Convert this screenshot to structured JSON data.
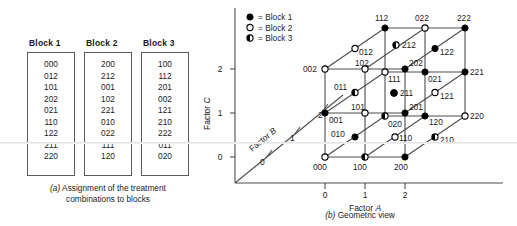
{
  "panel_a": {
    "caption_prefix": "(a)",
    "caption": " Assignment of the treatment",
    "caption_line2": "combinations to blocks",
    "blocks": [
      {
        "title": "Block 1",
        "runs": [
          "000",
          "012",
          "101",
          "202",
          "021",
          "110",
          "122",
          "211",
          "220"
        ]
      },
      {
        "title": "Block 2",
        "runs": [
          "200",
          "212",
          "001",
          "102",
          "221",
          "010",
          "022",
          "111",
          "120"
        ]
      },
      {
        "title": "Block 3",
        "runs": [
          "100",
          "112",
          "201",
          "002",
          "121",
          "210",
          "222",
          "011",
          "020"
        ]
      }
    ]
  },
  "panel_b": {
    "caption_prefix": "(b)",
    "caption": " Geometric view",
    "axes": {
      "x_label": "Factor ",
      "x_label_italic": "A",
      "y_label": "Factor ",
      "y_label_italic": "C",
      "z_label": "Factor ",
      "z_label_italic": "B",
      "x_ticks": [
        "0",
        "1",
        "2"
      ],
      "y_ticks": [
        "0",
        "1",
        "2"
      ],
      "z_ticks": [
        "0",
        "1",
        "2"
      ]
    },
    "legend": [
      {
        "marker": "filled-circle-icon",
        "text": "= Block 1"
      },
      {
        "marker": "open-circle-icon",
        "text": "= Block 2"
      },
      {
        "marker": "half-circle-icon",
        "text": "= Block 3"
      }
    ],
    "colors": {
      "line": "#4d4d4d",
      "marker_fill": "#000000",
      "marker_stroke": "#000000",
      "text": "#1a1a1a"
    },
    "points": [
      {
        "label": "000",
        "block": 2,
        "marker": "open"
      },
      {
        "label": "100",
        "block": 3,
        "marker": "half"
      },
      {
        "label": "200",
        "block": 1,
        "marker": "filled"
      },
      {
        "label": "010",
        "block": 2,
        "marker": "filled"
      },
      {
        "label": "110",
        "block": 1,
        "marker": "open"
      },
      {
        "label": "210",
        "block": 3,
        "marker": "half"
      },
      {
        "label": "020",
        "block": 3,
        "marker": "half"
      },
      {
        "label": "120",
        "block": 2,
        "marker": "filled"
      },
      {
        "label": "220",
        "block": 1,
        "marker": "open"
      },
      {
        "label": "001",
        "block": 1,
        "marker": "filled"
      },
      {
        "label": "101",
        "block": 1,
        "marker": "open"
      },
      {
        "label": "201",
        "block": 3,
        "marker": "filled"
      },
      {
        "label": "011",
        "block": 3,
        "marker": "half"
      },
      {
        "label": "111",
        "block": 2,
        "marker": "filled"
      },
      {
        "label": "211",
        "block": 1,
        "marker": "open"
      },
      {
        "label": "021",
        "block": 1,
        "marker": "open"
      },
      {
        "label": "121",
        "block": 3,
        "marker": "filled"
      },
      {
        "label": "221",
        "block": 2,
        "marker": "filled"
      },
      {
        "label": "002",
        "block": 1,
        "marker": "open"
      },
      {
        "label": "102",
        "block": 2,
        "marker": "open"
      },
      {
        "label": "202",
        "block": 1,
        "marker": "filled"
      },
      {
        "label": "012",
        "block": 1,
        "marker": "open"
      },
      {
        "label": "112",
        "block": 3,
        "marker": "half"
      },
      {
        "label": "212",
        "block": 2,
        "marker": "filled"
      },
      {
        "label": "022",
        "block": 3,
        "marker": "filled"
      },
      {
        "label": "122",
        "block": 1,
        "marker": "open"
      },
      {
        "label": "222",
        "block": 3,
        "marker": "filled"
      }
    ]
  }
}
